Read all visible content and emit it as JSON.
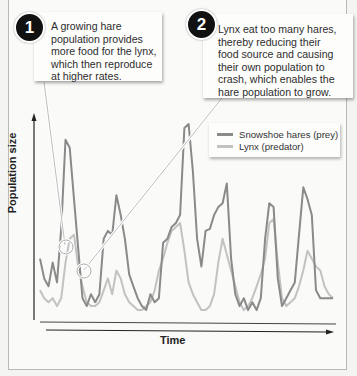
{
  "callouts": [
    {
      "number": "1",
      "text_lines": [
        "A growing hare",
        "population provides",
        "more food for the lynx,",
        "which then reproduce",
        "at higher rates."
      ]
    },
    {
      "number": "2",
      "text_lines": [
        "Lynx eat too many hares,",
        "thereby reducing their",
        "food source and causing",
        "their own population to",
        "crash, which enables the",
        "hare population to grow."
      ]
    }
  ],
  "legend": {
    "items": [
      {
        "label": "Snowshoe hares (prey)",
        "color": "#8a8a8a"
      },
      {
        "label": "Lynx (predator)",
        "color": "#c2c2c2"
      }
    ]
  },
  "axes": {
    "ylabel": "Population size",
    "xlabel": "Time"
  },
  "chart_data": {
    "type": "line",
    "title": "",
    "xlabel": "Time",
    "ylabel": "Population size",
    "grid": false,
    "legend_position": "upper right",
    "x": [
      0,
      1,
      2,
      3,
      4,
      5,
      6,
      7,
      8,
      9,
      10,
      11,
      12,
      13,
      14,
      15,
      16,
      17,
      18,
      19,
      20,
      21,
      22,
      23,
      24,
      25,
      26,
      27,
      28,
      29,
      30,
      31,
      32,
      33,
      34,
      35,
      36,
      37,
      38,
      39,
      40,
      41,
      42,
      43,
      44,
      45,
      46,
      47,
      48,
      49,
      50,
      51,
      52,
      53,
      54,
      55,
      56,
      57,
      58,
      59,
      60,
      61,
      62,
      63,
      64,
      65,
      66,
      67,
      68,
      69
    ],
    "series": [
      {
        "name": "Snowshoe hares (prey)",
        "color": "#8a8a8a",
        "values": [
          30,
          20,
          16,
          28,
          18,
          45,
          90,
          86,
          60,
          35,
          10,
          6,
          12,
          8,
          12,
          40,
          44,
          42,
          62,
          52,
          40,
          22,
          16,
          10,
          6,
          4,
          12,
          8,
          10,
          38,
          40,
          46,
          48,
          52,
          96,
          98,
          74,
          40,
          26,
          44,
          45,
          52,
          56,
          58,
          68,
          30,
          12,
          6,
          10,
          4,
          8,
          4,
          10,
          40,
          58,
          56,
          20,
          6,
          10,
          14,
          18,
          42,
          66,
          60,
          52,
          14,
          10,
          10,
          10,
          10
        ]
      },
      {
        "name": "Lynx (predator)",
        "color": "#c2c2c2",
        "values": [
          14,
          10,
          8,
          10,
          6,
          10,
          28,
          40,
          42,
          26,
          16,
          8,
          6,
          6,
          8,
          14,
          20,
          12,
          24,
          20,
          12,
          8,
          6,
          4,
          4,
          6,
          8,
          14,
          24,
          30,
          38,
          44,
          46,
          48,
          34,
          18,
          12,
          8,
          4,
          4,
          6,
          12,
          28,
          40,
          32,
          24,
          16,
          8,
          4,
          6,
          10,
          16,
          22,
          30,
          48,
          50,
          28,
          10,
          6,
          8,
          10,
          16,
          24,
          34,
          30,
          26,
          24,
          16,
          12,
          10
        ]
      }
    ],
    "annotations": [
      {
        "label": "1",
        "x": 6,
        "series": "Lynx (predator)"
      },
      {
        "label": "2",
        "x": 10,
        "series": "Snowshoe hares (prey)"
      }
    ]
  }
}
